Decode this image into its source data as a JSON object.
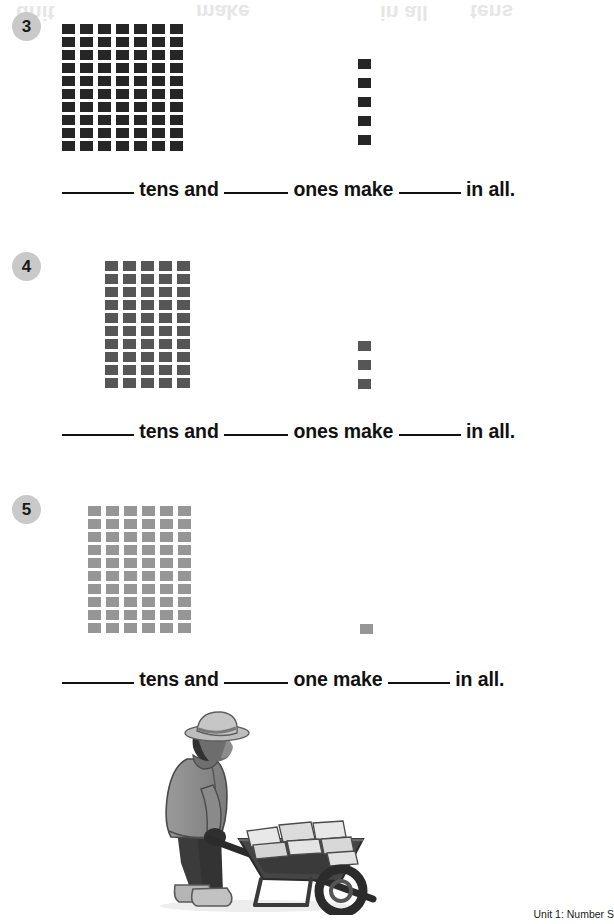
{
  "page": {
    "footer_text": "Unit 1: Number S",
    "ghost_text": [
      {
        "text": "unit",
        "left": 16,
        "top": 1
      },
      {
        "text": "make",
        "left": 196,
        "top": 0
      },
      {
        "text": "in all",
        "left": 380,
        "top": 1
      },
      {
        "text": "tens",
        "left": 470,
        "top": 0
      }
    ]
  },
  "problems": [
    {
      "number": "3",
      "badge_top": 12,
      "tens_count": 7,
      "tens_rows": 10,
      "ones_count": 5,
      "color": "#262626",
      "tens_left": 62,
      "tens_top": 24,
      "ones_left": 358,
      "ones_top": 59,
      "sentence_top": 178,
      "text": {
        "tens_word": "tens and",
        "ones_word": "ones make",
        "tail": "in all."
      }
    },
    {
      "number": "4",
      "badge_top": 252,
      "tens_count": 5,
      "tens_rows": 10,
      "ones_count": 3,
      "color": "#565656",
      "tens_left": 105,
      "tens_top": 261,
      "ones_left": 358,
      "ones_top": 341,
      "sentence_top": 420,
      "text": {
        "tens_word": "tens and",
        "ones_word": "ones make",
        "tail": "in all."
      }
    },
    {
      "number": "5",
      "badge_top": 495,
      "tens_count": 6,
      "tens_rows": 10,
      "ones_count": 1,
      "color": "#969696",
      "tens_left": 88,
      "tens_top": 506,
      "ones_left": 360,
      "ones_top": 624,
      "sentence_top": 668,
      "text": {
        "tens_word": "tens and",
        "ones_word": "one make",
        "tail": "in all."
      }
    }
  ],
  "illustration": {
    "name": "child-pushing-wheelbarrow-with-books",
    "colors": {
      "coat": "#8e8e8e",
      "hat": "#bdbdbd",
      "pants": "#3b3b3b",
      "boots": "#b5b5b5",
      "barrow": "#3f3f3f",
      "books": "#e2e2e2",
      "skin": "#6d6d6d"
    }
  }
}
